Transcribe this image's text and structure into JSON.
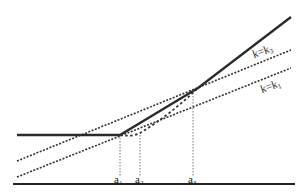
{
  "diagram": {
    "type": "piecewise-linear function with tangent lines",
    "labels": {
      "line_upper": "k=k",
      "line_upper_sub": "3",
      "line_lower": "k=k",
      "line_lower_sub": "1",
      "a1": "a",
      "a1_sub": "1",
      "a2": "a",
      "a2_sub": "2",
      "a3": "a",
      "a3_sub": "3"
    },
    "colors": {
      "solid": "#2a2a2a",
      "dashed": "#333333",
      "guide": "#555555"
    }
  }
}
